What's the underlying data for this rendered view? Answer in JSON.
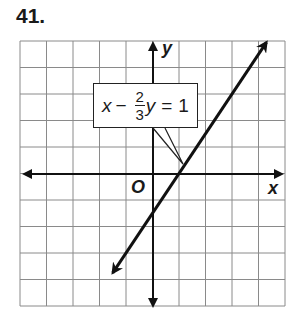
{
  "problem": {
    "number": "41."
  },
  "axes": {
    "x_label": "x",
    "y_label": "y",
    "origin_label": "O"
  },
  "equation": {
    "lhs_var": "x",
    "minus": "−",
    "frac_num": "2",
    "frac_den": "3",
    "rhs_var": "y",
    "equals": "=",
    "rhs": "1"
  },
  "colors": {
    "grid": "#8a8a8a",
    "axis": "#111111",
    "line": "#111111"
  },
  "chart_data": {
    "type": "line",
    "title": "41.",
    "xlabel": "x",
    "ylabel": "y",
    "xlim": [
      -5,
      5
    ],
    "ylim": [
      -5,
      5
    ],
    "grid": true,
    "legend": "none",
    "annotations": [
      "x − (2/3)y = 1"
    ],
    "series": [
      {
        "name": "x - (2/3)y = 1",
        "equation": "y = 1.5x - 1.5",
        "x": [
          -1.5,
          -1,
          0,
          1,
          2,
          3,
          4.3
        ],
        "y": [
          -3.75,
          -3,
          -1.5,
          0,
          1.5,
          3,
          4.95
        ]
      }
    ],
    "intercepts": {
      "x_intercept": 1,
      "y_intercept": -1.5
    }
  }
}
